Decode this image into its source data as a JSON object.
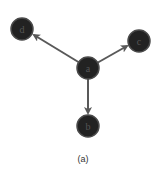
{
  "diagram": {
    "caption": "(a)",
    "node_color": "#222222",
    "node_stroke": "#4a4a4a",
    "label_color": "#555555",
    "edge_color": "#595959",
    "nodes": [
      {
        "id": "a",
        "label": "a",
        "x": 88,
        "y": 68
      },
      {
        "id": "b",
        "label": "b",
        "x": 88,
        "y": 126
      },
      {
        "id": "c",
        "label": "c",
        "x": 139,
        "y": 41
      },
      {
        "id": "d",
        "label": "d",
        "x": 22,
        "y": 29
      }
    ],
    "edges": [
      {
        "from": "a",
        "to": "d"
      },
      {
        "from": "a",
        "to": "c"
      },
      {
        "from": "a",
        "to": "b"
      }
    ]
  }
}
